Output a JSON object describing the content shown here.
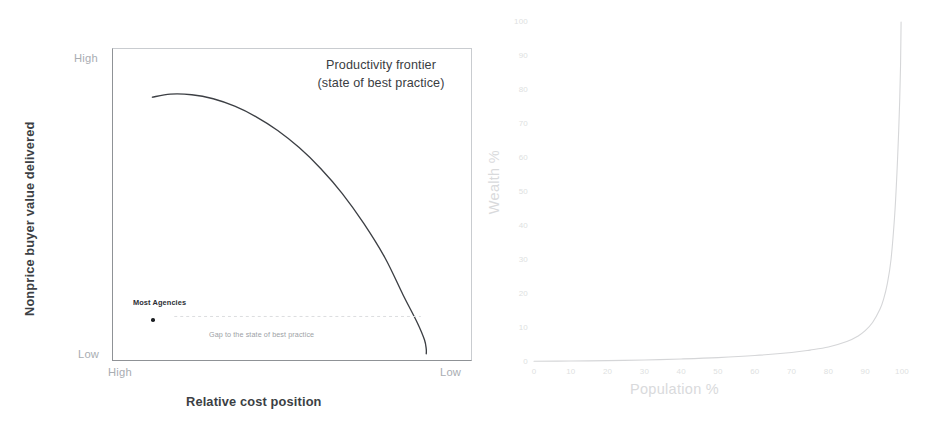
{
  "page": {
    "background_color": "#ffffff",
    "width": 936,
    "height": 435
  },
  "figures": {
    "left": {
      "name": "productivity-frontier-chart",
      "annotation_title_line1": "Productivity frontier",
      "annotation_title_line2": "(state of best practice)",
      "x_axis_title": "Relative cost position",
      "y_axis_title": "Nonprice buyer value delivered",
      "y_axis_top_label": "High",
      "y_axis_bottom_label": "Low",
      "x_axis_left_label": "High",
      "x_axis_right_label": "Low",
      "annotation_point_label": "Most Agencies",
      "annotation_gap_label": "Gap to the state of best practice",
      "curve_color": "#3c3f44",
      "axis_color": "#8f9296",
      "label_color": "#a9adb2"
    },
    "right": {
      "name": "wealth-distribution-chart",
      "x_axis_title": "Population %",
      "y_axis_title": "Wealth %",
      "curve_color": "#d5d6d8",
      "tick_color": "#dedfe1"
    }
  },
  "chart_data": [
    {
      "type": "line",
      "name": "productivity-frontier",
      "title": "Productivity frontier (state of best practice)",
      "xlabel": "Relative cost position",
      "ylabel": "Nonprice buyer value delivered",
      "xlim": [
        0,
        100
      ],
      "ylim": [
        0,
        100
      ],
      "x_tick_labels": [
        "High",
        "Low"
      ],
      "y_tick_labels": [
        "Low",
        "High"
      ],
      "grid": false,
      "legend": "none",
      "notes": "Qualitative schematic. X axis runs High cost (left) to Low cost (right); Y axis Low (bottom) to High (top) nonprice buyer value.",
      "series": [
        {
          "name": "Productivity frontier",
          "comment": "concave frontier arc from upper-left plateau to lower-right steep drop",
          "x": [
            11,
            16,
            22,
            28,
            34,
            40,
            46,
            52,
            58,
            64,
            70,
            76,
            81,
            85,
            87,
            87.5,
            87.5
          ],
          "y": [
            84.5,
            85.5,
            85.3,
            84.0,
            81.6,
            78.2,
            73.8,
            68.3,
            61.6,
            53.6,
            44.0,
            32.8,
            21.0,
            12.0,
            6.5,
            3.5,
            2.0
          ]
        }
      ],
      "annotations": [
        {
          "label": "Most Agencies",
          "type": "point-with-label",
          "x": 16,
          "y": 14
        },
        {
          "label": "Gap to the state of best practice",
          "type": "dashed-arrow",
          "x_start": 16,
          "y_start": 14,
          "x_end": 86,
          "y_end": 14
        },
        {
          "label": "Productivity frontier (state of best practice)",
          "type": "text-block",
          "x": 72,
          "y": 95
        }
      ]
    },
    {
      "type": "line",
      "name": "wealth-vs-population",
      "title": "",
      "xlabel": "Population %",
      "ylabel": "Wealth %",
      "xlim": [
        0,
        100
      ],
      "ylim": [
        0,
        100
      ],
      "x_ticks": [
        0,
        10,
        20,
        30,
        40,
        50,
        60,
        70,
        80,
        90,
        100
      ],
      "x_tick_labels": [
        "0",
        "10",
        "20",
        "30",
        "40",
        "50",
        "60",
        "70",
        "80",
        "90",
        "100"
      ],
      "y_ticks": [
        0,
        10,
        20,
        30,
        40,
        50,
        60,
        70,
        80,
        90,
        100
      ],
      "y_tick_labels": [
        "0",
        "10",
        "20",
        "30",
        "40",
        "50",
        "60",
        "70",
        "80",
        "90",
        "100"
      ],
      "grid": false,
      "legend": "none",
      "notes": "Steep exponential / Pareto-style wealth concentration curve: near-zero wealth share until ~80% of population, then rising sharply to 100% at the far right.",
      "series": [
        {
          "name": "Wealth share",
          "x": [
            0,
            10,
            20,
            30,
            40,
            50,
            60,
            70,
            75,
            80,
            85,
            88,
            90,
            92,
            94,
            95,
            96,
            97,
            98,
            98.6,
            99.1,
            99.4,
            99.6,
            99.7,
            99.75
          ],
          "y": [
            0.2,
            0.3,
            0.4,
            0.6,
            0.9,
            1.3,
            1.9,
            2.8,
            3.5,
            4.4,
            6.0,
            7.6,
            9.2,
            11.6,
            15.5,
            18.5,
            23.0,
            30.0,
            43.0,
            55.0,
            68.0,
            78.0,
            87.0,
            95.0,
            100.0
          ]
        }
      ]
    }
  ]
}
